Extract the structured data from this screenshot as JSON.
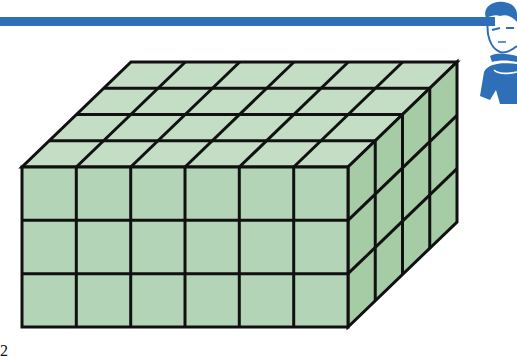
{
  "banner": {
    "color": "#2e6fb8"
  },
  "mascot": {
    "description": "cartoon boy with blue hair, arms crossed",
    "color": "#2e6fb8"
  },
  "diagram": {
    "title": "",
    "shape": "rectangular prism made of unit cubes",
    "dimensions": {
      "length": 6,
      "width": 4,
      "height": 3
    },
    "total_cubes": 72,
    "colors": {
      "front": "#b3d4b6",
      "top": "#c3dec4",
      "side": "#a6cca6",
      "stroke": "#111111"
    }
  },
  "footer": {
    "label": "2"
  }
}
